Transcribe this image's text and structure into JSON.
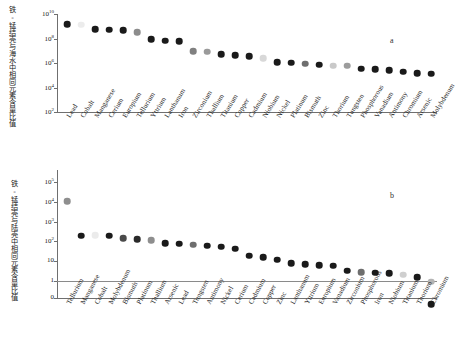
{
  "figure": {
    "panel_a_letter": "a",
    "panel_b_letter": "b"
  },
  "panel_a": {
    "ylabel_cn": "铁-锰结壳与海水中相同元素含量比值",
    "yticks": [
      "10²",
      "10⁴",
      "10⁶",
      "10⁸",
      "10¹⁰"
    ]
  },
  "panel_b": {
    "ylabel_cn": "铁-锰结壳与陆壳中相同元素含量比值",
    "yticks": [
      "0",
      "1",
      "10",
      "10²",
      "10³",
      "10⁴",
      "10⁵"
    ]
  },
  "chart_data": [
    {
      "type": "scatter",
      "panel": "a",
      "title": "",
      "xlabel": "",
      "ylabel": "铁-锰结壳与海水中相同元素含量比值",
      "yscale": "log",
      "ylim": [
        100,
        10000000000
      ],
      "ytick_values": [
        100,
        10000,
        1000000,
        100000000,
        10000000000
      ],
      "ytick_labels": [
        "10²",
        "10⁴",
        "10⁶",
        "10⁸",
        "10¹⁰"
      ],
      "grid": false,
      "legend": false,
      "categories": [
        "Lead",
        "Cobalt",
        "Manganese",
        "Cerium",
        "Europium",
        "Tellurium",
        "Yttrium",
        "Lanthanum",
        "Iron",
        "Zirconium",
        "Thallium",
        "Titanium",
        "Copper",
        "Cadmium",
        "Niobium",
        "Nickel",
        "Platinum",
        "Bismuth",
        "Zinc",
        "Thorium",
        "Tungsten",
        "Phosphorous",
        "Vanadium",
        "Antimony",
        "Chromium",
        "Arsenic",
        "Molybdenum"
      ],
      "values": [
        1500000000,
        1300000000,
        550000000,
        520000000,
        480000000,
        330000000,
        92000000,
        66000000,
        58000000,
        9500000,
        8200000,
        5000000,
        4300000,
        3600000,
        2400000,
        1200000,
        1050000,
        900000,
        750000,
        600000,
        580000,
        340000,
        320000,
        260000,
        195000,
        155000,
        135000
      ],
      "marker_shades": [
        "#1a1a1a",
        "#ececec",
        "#1a1a1a",
        "#1a1a1a",
        "#1a1a1a",
        "#8c8c8c",
        "#1a1a1a",
        "#1a1a1a",
        "#1a1a1a",
        "#808080",
        "#9a9a9a",
        "#1a1a1a",
        "#1a1a1a",
        "#1a1a1a",
        "#d8d8d8",
        "#1a1a1a",
        "#1a1a1a",
        "#6e6e6e",
        "#1a1a1a",
        "#c9c9c9",
        "#9c9c9c",
        "#1a1a1a",
        "#1a1a1a",
        "#1a1a1a",
        "#1a1a1a",
        "#1a1a1a",
        "#1a1a1a"
      ]
    },
    {
      "type": "scatter",
      "panel": "b",
      "title": "",
      "xlabel": "",
      "ylabel": "铁-锰结壳与陆壳中相同元素含量比值",
      "yscale": "log-with-zero",
      "ylim": [
        0,
        100000
      ],
      "ytick_values": [
        0,
        1,
        10,
        100,
        1000,
        10000,
        100000
      ],
      "ytick_labels": [
        "0",
        "1",
        "10",
        "10²",
        "10³",
        "10⁴",
        "10⁵"
      ],
      "reference_line": 1,
      "grid": false,
      "legend": false,
      "categories": [
        "Tellurium",
        "Manganese",
        "Cobalt",
        "Molybdenum",
        "Bismuth",
        "Platinum",
        "Thallium",
        "Arsenic",
        "Lead",
        "Tungsten",
        "Antimony",
        "Nickel",
        "Cerium",
        "Cadmium",
        "Copper",
        "Zinc",
        "Lanthanum",
        "Yttrium",
        "Europium",
        "Vanadium",
        "Zirconium",
        "Phosphorous",
        "Iron",
        "Niobium",
        "Titanium",
        "Thorium",
        "Chromium"
      ],
      "values": [
        11000,
        195,
        200,
        190,
        150,
        130,
        115,
        82,
        75,
        68,
        62,
        55,
        42,
        19,
        16,
        12,
        8.0,
        7.0,
        6.4,
        6.0,
        3.3,
        2.7,
        2.6,
        2.4,
        2.1,
        1.6,
        0.9
      ],
      "marker_shades": [
        "#8e8e8e",
        "#1a1a1a",
        "#ebebeb",
        "#1a1a1a",
        "#4a4a4a",
        "#2a2a2a",
        "#8e8e8e",
        "#1a1a1a",
        "#1a1a1a",
        "#6e6e6e",
        "#1a1a1a",
        "#1a1a1a",
        "#1a1a1a",
        "#1a1a1a",
        "#1a1a1a",
        "#1a1a1a",
        "#1a1a1a",
        "#1a1a1a",
        "#1a1a1a",
        "#1a1a1a",
        "#1a1a1a",
        "#6e6e6e",
        "#1a1a1a",
        "#1a1a1a",
        "#cfcfcf",
        "#1a1a1a",
        "#b4b4b4"
      ],
      "zero_point": {
        "category": "Chromium",
        "value": 0,
        "shade": "#1a1a1a"
      }
    }
  ]
}
